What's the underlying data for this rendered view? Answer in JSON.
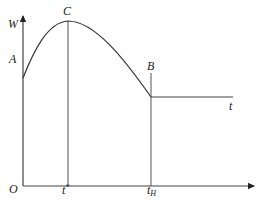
{
  "diagram": {
    "type": "function-curve",
    "colors": {
      "line": "#333333",
      "background": "#ffffff",
      "text": "#222222"
    },
    "axes": {
      "y_label": "W",
      "x_label": "t",
      "origin_label": "O"
    },
    "points": {
      "A": {
        "label": "A",
        "desc": "curve start on W axis"
      },
      "C": {
        "label": "C",
        "desc": "maximum of curve"
      },
      "B": {
        "label": "B",
        "desc": "curve end, start of constant segment"
      }
    },
    "ticks": {
      "t_star": {
        "base": "t",
        "sup": "*"
      },
      "t_H": {
        "base": "t",
        "sub": "H"
      }
    }
  }
}
